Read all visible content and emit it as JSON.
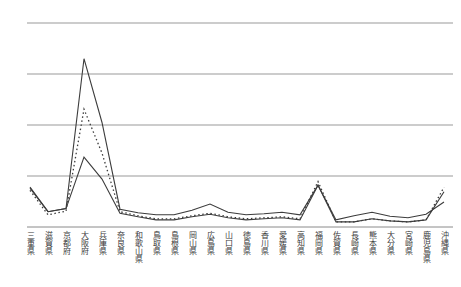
{
  "chart_data": {
    "type": "line",
    "title": "",
    "xlabel": "",
    "ylabel": "",
    "y_axis_labels": "none (unlabeled gridlines)",
    "ylim": [
      0,
      4
    ],
    "y_gridlines": [
      0,
      1,
      2,
      3,
      4
    ],
    "grid": "horizontal-only",
    "legend_position": "none",
    "value_unit": "gridline units (no tick labels visible in image)",
    "categories": [
      "三重県",
      "滋賀県",
      "京都府",
      "大阪府",
      "兵庫県",
      "奈良県",
      "和歌山県",
      "鳥取県",
      "島根県",
      "岡山県",
      "広島県",
      "山口県",
      "徳島県",
      "香川県",
      "愛媛県",
      "高知県",
      "福岡県",
      "佐賀県",
      "長崎県",
      "熊本県",
      "大分県",
      "宮崎県",
      "鹿児島県",
      "沖縄県"
    ],
    "series": [
      {
        "name": "solid-line-upper",
        "style": "solid",
        "color": "#3c3c3c",
        "values": [
          0.78,
          0.3,
          0.36,
          3.3,
          2.05,
          0.35,
          0.28,
          0.24,
          0.24,
          0.33,
          0.45,
          0.29,
          0.24,
          0.26,
          0.29,
          0.24,
          0.82,
          0.14,
          0.22,
          0.29,
          0.21,
          0.18,
          0.25,
          0.49
        ]
      },
      {
        "name": "dotted-line",
        "style": "dotted",
        "color": "#3c3c3c",
        "values": [
          0.72,
          0.24,
          0.31,
          2.31,
          1.45,
          0.3,
          0.22,
          0.16,
          0.16,
          0.22,
          0.27,
          0.2,
          0.16,
          0.18,
          0.2,
          0.16,
          0.89,
          0.1,
          0.1,
          0.16,
          0.12,
          0.1,
          0.14,
          0.78
        ]
      },
      {
        "name": "solid-line-lower",
        "style": "solid",
        "color": "#3c3c3c",
        "values": [
          0.76,
          0.3,
          0.36,
          1.37,
          0.94,
          0.27,
          0.2,
          0.14,
          0.14,
          0.2,
          0.25,
          0.18,
          0.14,
          0.16,
          0.18,
          0.14,
          0.82,
          0.1,
          0.1,
          0.16,
          0.12,
          0.1,
          0.14,
          0.69
        ]
      }
    ],
    "colors": {
      "background": "#ffffff",
      "gridline": "#999999",
      "axis": "#8a8a8a",
      "line": "#3c3c3c",
      "label_text": "#3a3a3a"
    }
  }
}
